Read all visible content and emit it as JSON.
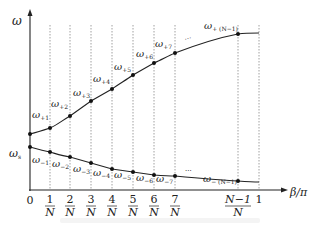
{
  "diagram": {
    "y_axis_label": "ω",
    "x_axis_label": "β/π",
    "left_marker": {
      "base": "ω",
      "sub": "s"
    },
    "x_ticks": [
      {
        "num": "0",
        "den": ""
      },
      {
        "num": "1",
        "den": "N"
      },
      {
        "num": "2",
        "den": "N"
      },
      {
        "num": "3",
        "den": "N"
      },
      {
        "num": "4",
        "den": "N"
      },
      {
        "num": "5",
        "den": "N"
      },
      {
        "num": "6",
        "den": "N"
      },
      {
        "num": "7",
        "den": "N"
      },
      {
        "num": "N−1",
        "den": "N"
      },
      {
        "num": "1",
        "den": ""
      }
    ],
    "upper_labels": [
      {
        "base": "ω",
        "sub": "+1"
      },
      {
        "base": "ω",
        "sub": "+2"
      },
      {
        "base": "ω",
        "sub": "+3"
      },
      {
        "base": "ω",
        "sub": "+4"
      },
      {
        "base": "ω",
        "sub": "+5"
      },
      {
        "base": "ω",
        "sub": "+6"
      },
      {
        "base": "ω",
        "sub": "+7"
      },
      {
        "base": "ω",
        "sub": "+ (N−1)"
      }
    ],
    "lower_labels": [
      {
        "base": "ω",
        "sub": "−1"
      },
      {
        "base": "ω",
        "sub": "−2"
      },
      {
        "base": "ω",
        "sub": "−3"
      },
      {
        "base": "ω",
        "sub": "−4"
      },
      {
        "base": "ω",
        "sub": "−5"
      },
      {
        "base": "ω",
        "sub": "−6"
      },
      {
        "base": "ω",
        "sub": "−7"
      },
      {
        "base": "ω",
        "sub": "− (N−1)"
      }
    ],
    "ellipsis": "···",
    "colors": {
      "line": "#222222",
      "grid": "#888888"
    }
  }
}
